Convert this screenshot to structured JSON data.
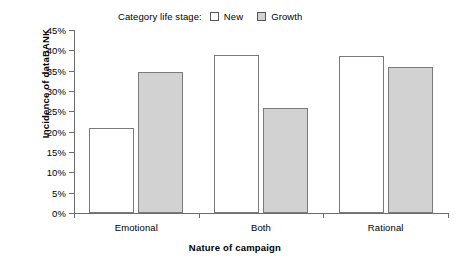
{
  "chart_data": {
    "type": "bar",
    "title": "",
    "xlabel": "Nature of campaign",
    "ylabel": "Incidence of dataBANK",
    "categories": [
      "Emotional",
      "Both",
      "Rational"
    ],
    "series": [
      {
        "name": "New",
        "color": "#ffffff",
        "values": [
          20.9,
          38.8,
          38.6
        ]
      },
      {
        "name": "Growth",
        "color": "#d2d2d2",
        "values": [
          34.7,
          25.8,
          36.0
        ]
      }
    ],
    "ylim": [
      0,
      45
    ],
    "ytick_labels": [
      "45%",
      "40%",
      "35%",
      "30%",
      "25%",
      "20%",
      "15%",
      "10%",
      "5%",
      "0%"
    ],
    "ytick_values": [
      45,
      40,
      35,
      30,
      25,
      20,
      15,
      10,
      5,
      0
    ],
    "grid": false,
    "legend_position": "top",
    "legend_title": "Category life stage:"
  },
  "legend": {
    "title": "Category life stage:",
    "entries": [
      {
        "label": "New",
        "swatch": "white-square-swatch"
      },
      {
        "label": "Growth",
        "swatch": "gray-square-swatch"
      }
    ]
  },
  "axes": {
    "y_title": "Incidence of dataBANK",
    "x_title": "Nature of campaign"
  }
}
